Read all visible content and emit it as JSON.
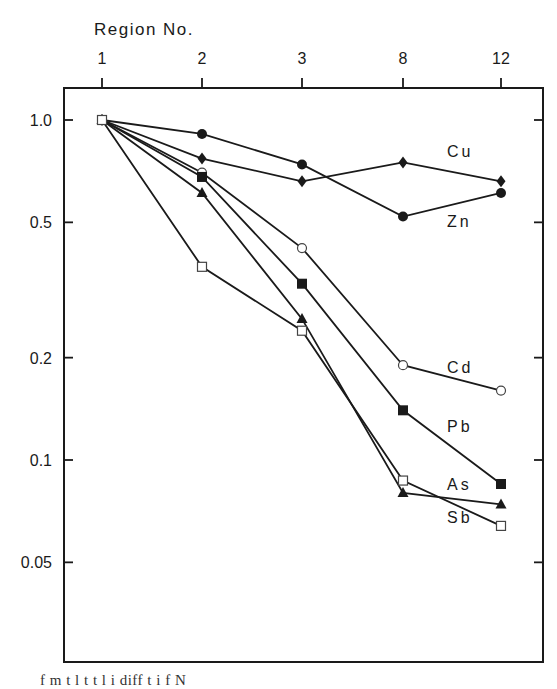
{
  "chart_data": {
    "type": "line",
    "title": "",
    "xlabel": "Region No.",
    "ylabel": "",
    "x_axis_position": "top",
    "y_scale": "log",
    "ylim": [
      0.025,
      1.15
    ],
    "grid": false,
    "categories": [
      "1",
      "2",
      "3",
      "8",
      "12"
    ],
    "y_ticks": [
      1.0,
      0.5,
      0.2,
      0.1,
      0.05
    ],
    "y_tick_labels": [
      "1.0",
      "0.5",
      "0.2",
      "0.1",
      "0.05"
    ],
    "series": [
      {
        "name": "Cu",
        "marker": "filled-diamond",
        "values": [
          1.0,
          0.77,
          0.66,
          0.75,
          0.66
        ]
      },
      {
        "name": "Zn",
        "marker": "filled-circle",
        "values": [
          1.0,
          0.91,
          0.74,
          0.52,
          0.61
        ]
      },
      {
        "name": "Cd",
        "marker": "open-circle",
        "values": [
          1.0,
          0.7,
          0.42,
          0.19,
          0.16
        ]
      },
      {
        "name": "Pb",
        "marker": "filled-square",
        "values": [
          1.0,
          0.68,
          0.33,
          0.14,
          0.085
        ]
      },
      {
        "name": "As",
        "marker": "filled-triangle",
        "values": [
          1.0,
          0.61,
          0.26,
          0.08,
          0.074
        ]
      },
      {
        "name": "Sb",
        "marker": "open-square",
        "values": [
          1.0,
          0.37,
          0.24,
          0.087,
          0.064
        ]
      }
    ],
    "annotations": [
      {
        "text": "Cu",
        "x": 447,
        "y": 157
      },
      {
        "text": "Zn",
        "x": 447,
        "y": 227
      },
      {
        "text": "Cd",
        "x": 447,
        "y": 373
      },
      {
        "text": "Pb",
        "x": 447,
        "y": 432
      },
      {
        "text": "As",
        "x": 447,
        "y": 490
      },
      {
        "text": "Sb",
        "x": 447,
        "y": 523
      }
    ],
    "legend": "inline labels at right"
  },
  "caption": "f       m   t  l      t  t   l   i   diff      t     i     f N"
}
